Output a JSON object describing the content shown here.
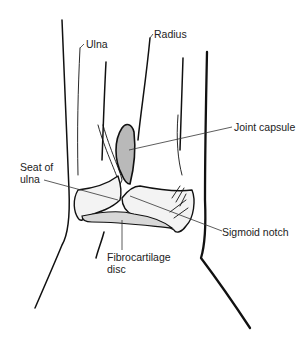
{
  "figure": {
    "background": "#ffffff",
    "ink_color": "#111111"
  },
  "labels": {
    "ulna": "Ulna",
    "radius": "Radius",
    "joint_capsule": "Joint capsule",
    "seat_of_ulna": "Seat of\nulna",
    "sigmoid_notch": "Sigmoid notch",
    "fibrocartilage_disc": "Fibrocartilage\ndisc"
  }
}
